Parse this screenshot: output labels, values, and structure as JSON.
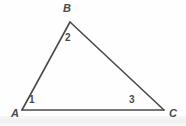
{
  "figure": {
    "kind": "geometry-triangle-diagram",
    "background_color": "#fefefe",
    "stroke_color": "#4a4a4a",
    "stroke_width": 1.6,
    "width": 186,
    "height": 126,
    "vertices": [
      {
        "id": "A",
        "label": "A",
        "x": 22,
        "y": 110,
        "label_x": 11,
        "label_y": 108
      },
      {
        "id": "B",
        "label": "B",
        "x": 70,
        "y": 22,
        "label_x": 63,
        "label_y": 3
      },
      {
        "id": "C",
        "label": "C",
        "x": 164,
        "y": 110,
        "label_x": 169,
        "label_y": 108
      }
    ],
    "sides": [
      {
        "id": "AB",
        "from": "A",
        "to": "B",
        "x1": 22,
        "y1": 110,
        "x2": 70,
        "y2": 22
      },
      {
        "id": "BC",
        "from": "B",
        "to": "C",
        "x1": 70,
        "y1": 22,
        "x2": 164,
        "y2": 110
      },
      {
        "id": "AC",
        "from": "A",
        "to": "C",
        "x1": 22,
        "y1": 110,
        "x2": 164,
        "y2": 110
      }
    ],
    "angle_labels": [
      {
        "id": "angle-1",
        "label": "1",
        "at_vertex": "A",
        "x": 29,
        "y": 95
      },
      {
        "id": "angle-2",
        "label": "2",
        "at_vertex": "B",
        "x": 65,
        "y": 33
      },
      {
        "id": "angle-3",
        "label": "3",
        "at_vertex": "C",
        "x": 129,
        "y": 95
      }
    ]
  }
}
